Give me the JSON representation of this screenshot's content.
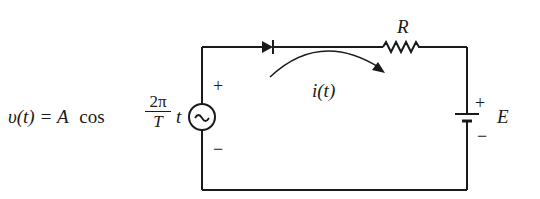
{
  "diagram": {
    "type": "circuit",
    "source": {
      "equation_lhs": "υ(t) = A",
      "equation_func": "cos",
      "fraction_num": "2π",
      "fraction_den": "T",
      "equation_tail": "t",
      "symbol": "~",
      "plus": "+",
      "minus": "−"
    },
    "diode": {
      "label": ""
    },
    "resistor": {
      "label": "R"
    },
    "current": {
      "label": "i(t)"
    },
    "battery": {
      "label": "E",
      "plus": "+",
      "minus": "−"
    },
    "colors": {
      "stroke": "#1a1a1a",
      "background": "#ffffff"
    }
  }
}
